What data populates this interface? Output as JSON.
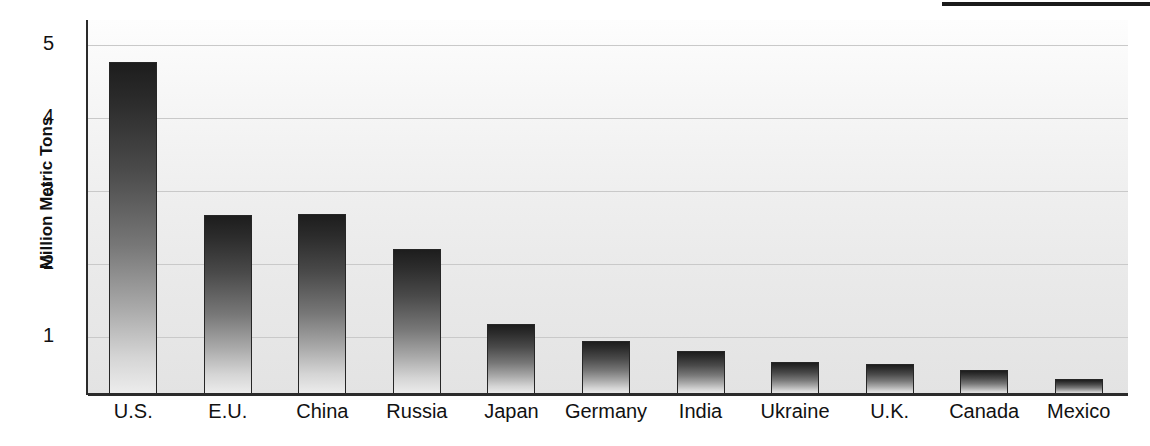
{
  "chart_data": {
    "type": "bar",
    "title": "",
    "xlabel": "",
    "ylabel": "Million Metric Tons",
    "categories": [
      "U.S.",
      "E.U.",
      "China",
      "Russia",
      "Japan",
      "Germany",
      "India",
      "Ukraine",
      "U.K.",
      "Canada",
      "Mexico"
    ],
    "values": [
      4.77,
      2.67,
      2.68,
      2.2,
      1.17,
      0.94,
      0.81,
      0.65,
      0.62,
      0.54,
      0.42
    ],
    "yticks": [
      1,
      2,
      3,
      4,
      5
    ],
    "ytick_labels": [
      "1",
      "2",
      "3",
      "4",
      "5"
    ],
    "ylim": [
      0.2,
      5.35
    ],
    "grid": "horizontal",
    "legend": "none"
  },
  "axis": {
    "y_title": "Million Metric Tons"
  },
  "decor": {
    "top_rule": "horizontal-rule"
  }
}
